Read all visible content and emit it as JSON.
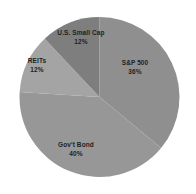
{
  "chart_data": {
    "type": "pie",
    "title": "",
    "direction": "clockwise",
    "start_angle_deg": 0,
    "background": "#ffffff",
    "label_color": "#1f1f1f",
    "center_px": {
      "x": 99.5,
      "y": 97
    },
    "radius_px": 80,
    "legend": "none",
    "categories": [
      "S&P 500",
      "Gov't Bond",
      "REITs",
      "U.S. Small Cap"
    ],
    "values": [
      36,
      40,
      12,
      12
    ],
    "segments": [
      {
        "label": "S&P 500",
        "value": 36,
        "pct_label": "36%",
        "color": "#8f8f8f",
        "label_px": {
          "x": 135,
          "y": 67
        }
      },
      {
        "label": "Gov't Bond",
        "value": 40,
        "pct_label": "40%",
        "color": "#979797",
        "label_px": {
          "x": 76,
          "y": 149
        }
      },
      {
        "label": "REITs",
        "value": 12,
        "pct_label": "12%",
        "color": "#a4a4a4",
        "label_px": {
          "x": 37,
          "y": 65
        }
      },
      {
        "label": "U.S. Small Cap",
        "value": 12,
        "pct_label": "12%",
        "color": "#7e7e7e",
        "label_px": {
          "x": 81,
          "y": 37
        }
      }
    ]
  }
}
